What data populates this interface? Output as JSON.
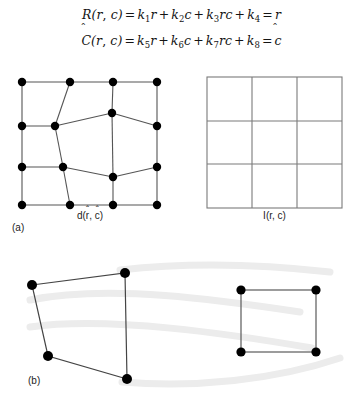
{
  "figure": {
    "equations": [
      {
        "id": "row-mapping",
        "text": "R̂(r, c) = k1r + k2c + k3rc + k4 = r̂",
        "lhs_symbol": "R",
        "lhs_args": "(r, c)",
        "terms": [
          {
            "coef": "k",
            "sub": "1",
            "vars": "r"
          },
          {
            "coef": "k",
            "sub": "2",
            "vars": "c"
          },
          {
            "coef": "k",
            "sub": "3",
            "vars": "rc"
          },
          {
            "coef": "k",
            "sub": "4",
            "vars": ""
          }
        ],
        "result": "r"
      },
      {
        "id": "col-mapping",
        "text": "Ĉ(r, c) = k5r + k6c + k7rc + k8 = ĉ",
        "lhs_symbol": "C",
        "lhs_args": "(r, c)",
        "terms": [
          {
            "coef": "k",
            "sub": "5",
            "vars": "r"
          },
          {
            "coef": "k",
            "sub": "6",
            "vars": "c"
          },
          {
            "coef": "k",
            "sub": "7",
            "vars": "rc"
          },
          {
            "coef": "k",
            "sub": "8",
            "vars": ""
          }
        ],
        "result": "c"
      }
    ],
    "panel_a": {
      "tag": "(a)",
      "left_label": "d(r̂, ĉ)",
      "right_label": "I(r, c)",
      "distorted_mesh": {
        "description": "quadrilateral mesh with distorted interior vertices and filled circular nodes",
        "node_radius": 4.2,
        "node_color": "#000000",
        "edge_color": "#555555",
        "nodes": [
          {
            "id": "n00",
            "x": 22,
            "y": 82
          },
          {
            "id": "n01",
            "x": 70,
            "y": 82
          },
          {
            "id": "n02",
            "x": 113,
            "y": 82
          },
          {
            "id": "n03",
            "x": 157,
            "y": 82
          },
          {
            "id": "n10",
            "x": 22,
            "y": 126
          },
          {
            "id": "n11",
            "x": 55,
            "y": 126
          },
          {
            "id": "n12",
            "x": 112,
            "y": 113
          },
          {
            "id": "n13",
            "x": 157,
            "y": 126
          },
          {
            "id": "n20",
            "x": 22,
            "y": 167
          },
          {
            "id": "n21",
            "x": 63,
            "y": 167
          },
          {
            "id": "n22",
            "x": 113,
            "y": 177
          },
          {
            "id": "n23",
            "x": 157,
            "y": 167
          },
          {
            "id": "n30",
            "x": 22,
            "y": 205
          },
          {
            "id": "n31",
            "x": 70,
            "y": 205
          },
          {
            "id": "n32",
            "x": 113,
            "y": 205
          },
          {
            "id": "n33",
            "x": 157,
            "y": 205
          }
        ],
        "edges": [
          [
            "n00",
            "n01"
          ],
          [
            "n01",
            "n02"
          ],
          [
            "n02",
            "n03"
          ],
          [
            "n00",
            "n10"
          ],
          [
            "n10",
            "n11"
          ],
          [
            "n11",
            "n12"
          ],
          [
            "n12",
            "n13"
          ],
          [
            "n13",
            "n03"
          ],
          [
            "n01",
            "n11"
          ],
          [
            "n02",
            "n12"
          ],
          [
            "n10",
            "n20"
          ],
          [
            "n20",
            "n21"
          ],
          [
            "n21",
            "n22"
          ],
          [
            "n22",
            "n23"
          ],
          [
            "n23",
            "n13"
          ],
          [
            "n11",
            "n21"
          ],
          [
            "n12",
            "n22"
          ],
          [
            "n20",
            "n30"
          ],
          [
            "n30",
            "n31"
          ],
          [
            "n31",
            "n32"
          ],
          [
            "n32",
            "n33"
          ],
          [
            "n33",
            "n23"
          ],
          [
            "n21",
            "n31"
          ],
          [
            "n22",
            "n32"
          ]
        ]
      },
      "regular_grid": {
        "description": "undistorted 3 by 3 square grid",
        "rows": 3,
        "cols": 3,
        "x": 207,
        "y": 77,
        "width": 135,
        "height": 131,
        "line_color": "#7a7a7a",
        "border_color": "#6e6e6e"
      }
    },
    "panel_b": {
      "tag": "(b)",
      "distorted_quad": {
        "description": "single distorted quadrilateral cell with filled corner nodes",
        "nodes": [
          {
            "id": "q-tl",
            "x": 32,
            "y": 285
          },
          {
            "id": "q-tr",
            "x": 125,
            "y": 273
          },
          {
            "id": "q-bl",
            "x": 48,
            "y": 356
          },
          {
            "id": "q-br",
            "x": 127,
            "y": 379
          }
        ],
        "edges": [
          [
            "q-tl",
            "q-tr"
          ],
          [
            "q-tr",
            "q-br"
          ],
          [
            "q-br",
            "q-bl"
          ],
          [
            "q-bl",
            "q-tl"
          ]
        ]
      },
      "target_square": {
        "description": "undistorted square cell with filled corner nodes",
        "nodes": [
          {
            "id": "s-tl",
            "x": 241,
            "y": 290
          },
          {
            "id": "s-tr",
            "x": 316,
            "y": 290
          },
          {
            "id": "s-bl",
            "x": 241,
            "y": 352
          },
          {
            "id": "s-br",
            "x": 316,
            "y": 352
          }
        ],
        "edges": [
          [
            "s-tl",
            "s-tr"
          ],
          [
            "s-tr",
            "s-br"
          ],
          [
            "s-br",
            "s-bl"
          ],
          [
            "s-bl",
            "s-tl"
          ]
        ]
      },
      "mapping_arrows": {
        "description": "faint light-gray curved arrows linking the distorted quadrilateral to the square",
        "color": "#ececec",
        "count": 4
      }
    },
    "colors": {
      "background": "#ffffff",
      "node_fill": "#000000",
      "mesh_line": "#555555",
      "grid_line": "#7a7a7a",
      "faint_arrow": "#ececec",
      "text": "#1a1a1a"
    }
  }
}
